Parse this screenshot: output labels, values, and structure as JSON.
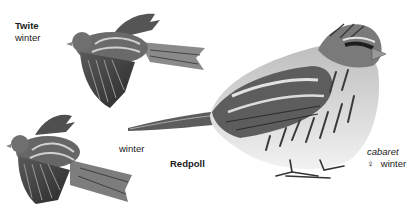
{
  "plate": {
    "species": [
      {
        "name": "Twite",
        "variants": [
          {
            "label": "winter",
            "pose": "flight-upper"
          },
          {
            "label": "winter",
            "pose": "flight-lower"
          }
        ]
      },
      {
        "name": "Redpoll",
        "subspecies": "cabaret",
        "sex_symbol": "♀",
        "variant": "winter",
        "pose": "perched"
      }
    ],
    "labels": {
      "twite_name": "Twite",
      "twite_variant_top": "winter",
      "twite_variant_bottom": "winter",
      "redpoll_name": "Redpoll",
      "redpoll_subspecies": "cabaret",
      "redpoll_sex": "♀",
      "redpoll_variant": "winter"
    },
    "colors": {
      "background": "#ffffff",
      "text": "#1a1a1a",
      "plumage_dark": "#2e2e2e",
      "plumage_mid": "#7a7a7a",
      "plumage_light": "#d6d6d6"
    }
  }
}
